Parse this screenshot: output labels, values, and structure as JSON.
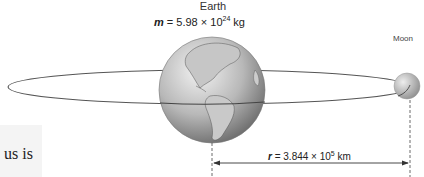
{
  "figure": {
    "earth_label": "Earth",
    "mass": {
      "symbol": "m",
      "equals": " = 5.98 × 10",
      "exponent": "24",
      "unit": " kg"
    },
    "moon_label": "Moon",
    "distance": {
      "symbol": "r",
      "equals": " = 3.844 × 10",
      "exponent": "5",
      "unit": " km"
    },
    "side_text": "us is"
  },
  "colors": {
    "orbit_line": "#555555",
    "earth_light": "#e6e6e6",
    "earth_dark": "#6e6e6e",
    "moon_light": "#dedede",
    "moon_dark": "#8a8a8a",
    "side_box": "#f4f4f4"
  }
}
